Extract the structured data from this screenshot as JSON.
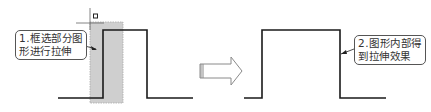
{
  "diagram": {
    "left_panel": {
      "callout": {
        "line1": "1.框选部分图",
        "line2": "形进行拉伸"
      }
    },
    "right_panel": {
      "callout": {
        "line1": "2.图形内部得",
        "line2": "到拉伸效果"
      }
    },
    "transition_arrow": "right-arrow",
    "colors": {
      "line": "#1a1a1a",
      "selection_fill": "#c8c8c8",
      "callout_border": "#555555",
      "arrow_stroke": "#888888"
    }
  }
}
